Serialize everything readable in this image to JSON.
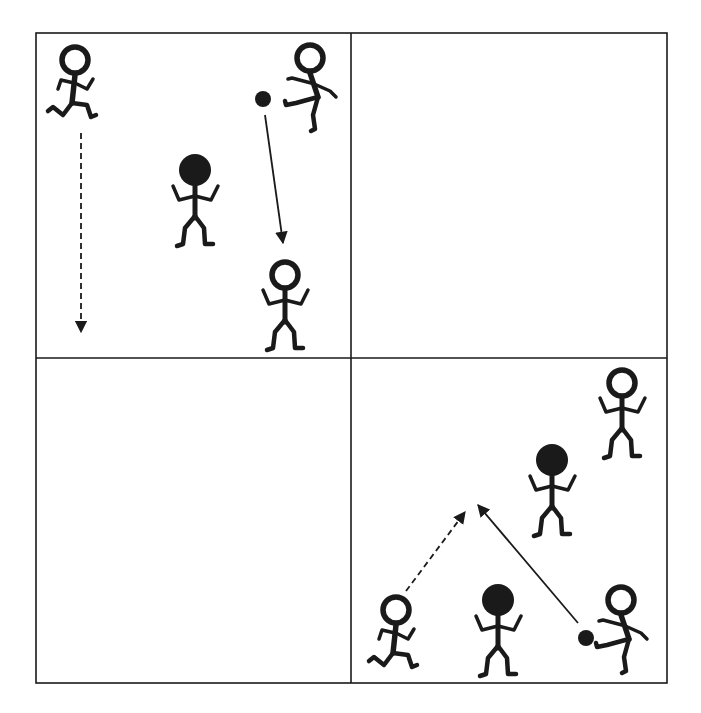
{
  "diagram": {
    "type": "soccer-drill",
    "grid": {
      "rows": 2,
      "cols": 2,
      "left": 36,
      "top": 33,
      "right": 667,
      "bottom": 683,
      "mid_x": 351,
      "mid_y": 358
    },
    "colors": {
      "line": "#1a1a1a",
      "background": "#ffffff"
    },
    "quadrants": [
      {
        "id": "top-left",
        "players": [
          {
            "id": "runner",
            "team": "white",
            "pose": "running",
            "x": 75,
            "y": 60
          },
          {
            "id": "kicker",
            "team": "white",
            "pose": "kicking",
            "x": 310,
            "y": 58
          },
          {
            "id": "defender",
            "team": "black",
            "pose": "standing",
            "x": 195,
            "y": 170
          },
          {
            "id": "receiver",
            "team": "white",
            "pose": "standing",
            "x": 285,
            "y": 275
          }
        ],
        "balls": [
          {
            "x": 263,
            "y": 99
          }
        ],
        "arrows": [
          {
            "type": "run",
            "style": "dashed",
            "x1": 81,
            "y1": 133,
            "x2": 81,
            "y2": 332
          },
          {
            "type": "pass",
            "style": "solid",
            "x1": 265,
            "y1": 115,
            "x2": 283,
            "y2": 243
          }
        ]
      },
      {
        "id": "top-right",
        "players": [],
        "balls": [],
        "arrows": []
      },
      {
        "id": "bottom-left",
        "players": [],
        "balls": [],
        "arrows": []
      },
      {
        "id": "bottom-right",
        "players": [
          {
            "id": "receiver",
            "team": "white",
            "pose": "standing",
            "x": 622,
            "y": 383
          },
          {
            "id": "defender-1",
            "team": "black",
            "pose": "standing",
            "x": 552,
            "y": 460
          },
          {
            "id": "runner",
            "team": "white",
            "pose": "running",
            "x": 396,
            "y": 610
          },
          {
            "id": "defender-2",
            "team": "black",
            "pose": "standing",
            "x": 498,
            "y": 600
          },
          {
            "id": "kicker",
            "team": "white",
            "pose": "kicking",
            "x": 621,
            "y": 600
          }
        ],
        "balls": [
          {
            "x": 586,
            "y": 638
          }
        ],
        "arrows": [
          {
            "type": "run",
            "style": "dashed",
            "x1": 406,
            "y1": 591,
            "x2": 465,
            "y2": 512
          },
          {
            "type": "pass",
            "style": "solid",
            "x1": 578,
            "y1": 623,
            "x2": 478,
            "y2": 505
          }
        ]
      }
    ]
  }
}
